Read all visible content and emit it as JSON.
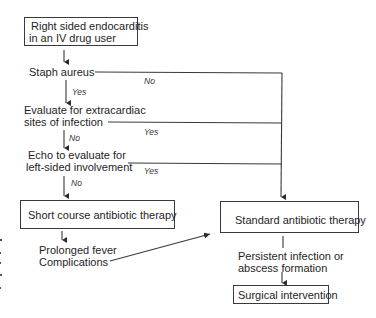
{
  "diagram": {
    "type": "flowchart",
    "colors": {
      "line": "#3a3a3a",
      "text": "#1e1e1e",
      "background": "#ffffff"
    },
    "nodes": {
      "start": {
        "line1": "Right sided endocarditis",
        "line2": "in an IV drug user"
      },
      "staph": {
        "label": "Staph aureus"
      },
      "extracardiac": {
        "line1": "Evaluate for extracardiac",
        "line2": "sites of infection"
      },
      "echo": {
        "line1": "Echo to evaluate for",
        "line2": "left-sided involvement"
      },
      "short_course": {
        "label": "Short course antibiotic  therapy"
      },
      "prolonged": {
        "line1": "Prolonged fever",
        "line2": "Complications"
      },
      "standard": {
        "label": "Standard antibiotic therapy"
      },
      "persistent": {
        "line1": "Persistent infection or",
        "line2": "abscess formation"
      },
      "surgical": {
        "label": "Surgical intervention"
      }
    },
    "edges": [
      {
        "from": "start",
        "to": "staph",
        "label": ""
      },
      {
        "from": "staph",
        "to": "extracardiac",
        "label": "Yes"
      },
      {
        "from": "staph",
        "to": "standard",
        "label": "No"
      },
      {
        "from": "extracardiac",
        "to": "echo",
        "label": "No"
      },
      {
        "from": "extracardiac",
        "to": "standard",
        "label": "Yes"
      },
      {
        "from": "echo",
        "to": "short_course",
        "label": "No"
      },
      {
        "from": "echo",
        "to": "standard",
        "label": "Yes"
      },
      {
        "from": "short_course",
        "to": "prolonged",
        "label": ""
      },
      {
        "from": "prolonged",
        "to": "standard",
        "label": ""
      },
      {
        "from": "standard",
        "to": "persistent",
        "label": ""
      },
      {
        "from": "persistent",
        "to": "surgical",
        "label": ""
      }
    ],
    "labels": {
      "staph_no": "No",
      "staph_yes": "Yes",
      "extracardiac_yes": "Yes",
      "extracardiac_no": "No",
      "echo_yes": "Yes",
      "echo_no": "No"
    }
  }
}
